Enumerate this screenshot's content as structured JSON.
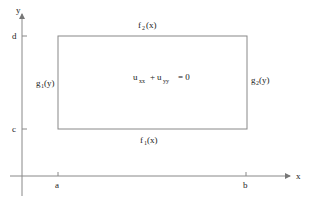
{
  "diagram": {
    "axes": {
      "x_label": "x",
      "y_label": "y",
      "x_ticks": [
        "a",
        "b"
      ],
      "y_ticks": [
        "d",
        "c"
      ]
    },
    "equation": {
      "term1": "u",
      "term1_sub": "xx",
      "plus": "+",
      "term2": "u",
      "term2_sub": "yy",
      "rhs": "= 0"
    },
    "boundaries": {
      "top": {
        "name": "f",
        "sub": "2",
        "arg": "(x)"
      },
      "bottom": {
        "name": "f",
        "sub": "1",
        "arg": "(x)"
      },
      "left": {
        "name": "g",
        "sub": "1",
        "arg": "(y)"
      },
      "right": {
        "name": "g",
        "sub": "2",
        "arg": "(y)"
      }
    },
    "colors": {
      "line": "#888888",
      "text": "#222222"
    }
  }
}
